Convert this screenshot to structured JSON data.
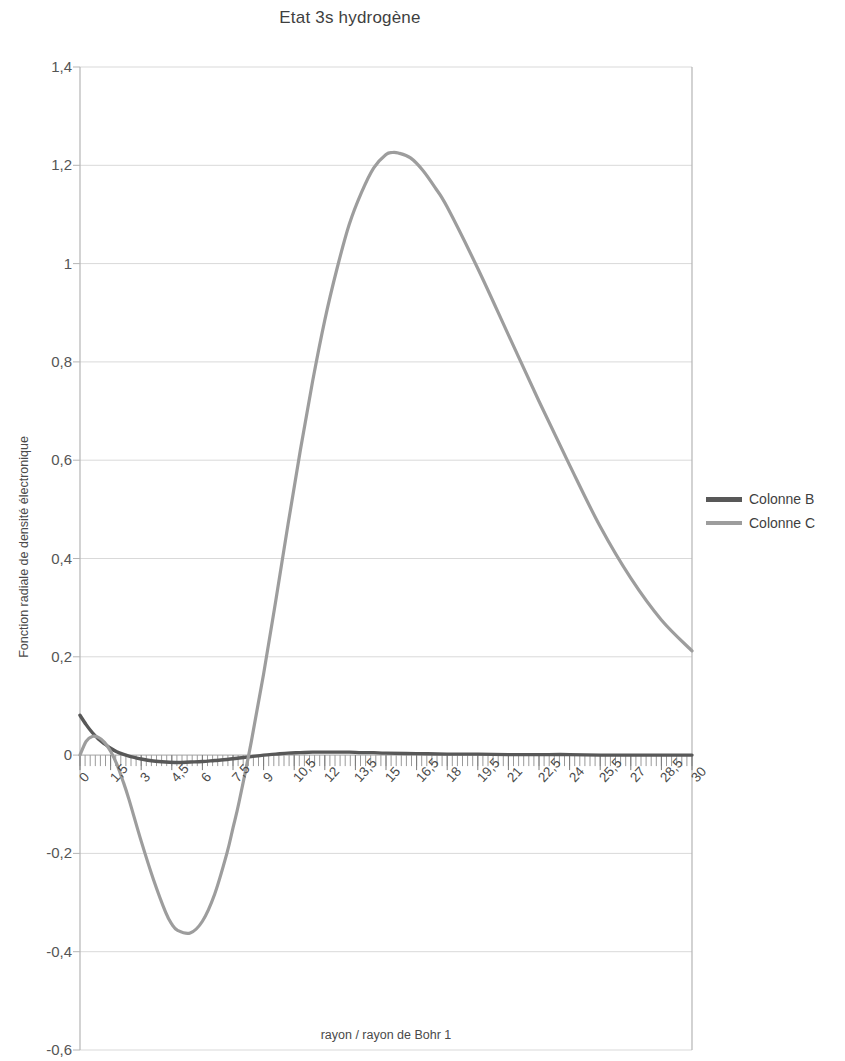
{
  "chart_data": {
    "type": "line",
    "title": "Etat 3s hydrogène",
    "xlabel": "rayon / rayon de Bohr 1",
    "ylabel": "Fonction radiale de densité électronique",
    "xlim": [
      0,
      30
    ],
    "ylim": [
      -0.6,
      1.4
    ],
    "grid": true,
    "legend_position": "right",
    "x_tick_labels": [
      "0",
      "1,5",
      "3",
      "4,5",
      "6",
      "7,5",
      "9",
      "10,5",
      "12",
      "13,5",
      "15",
      "16,5",
      "18",
      "19,5",
      "21",
      "22,5",
      "24",
      "25,5",
      "27",
      "28,5",
      "30"
    ],
    "x_tick_values": [
      0,
      1.5,
      3,
      4.5,
      6,
      7.5,
      9,
      10.5,
      12,
      13.5,
      15,
      16.5,
      18,
      19.5,
      21,
      22.5,
      24,
      25.5,
      27,
      28.5,
      30
    ],
    "y_tick_labels": [
      "1,4",
      "1,2",
      "1",
      "0,8",
      "0,6",
      "0,4",
      "0,2",
      "0",
      "-0,2",
      "-0,4",
      "-0,6"
    ],
    "y_tick_values": [
      1.4,
      1.2,
      1,
      0.8,
      0.6,
      0.4,
      0.2,
      0,
      -0.2,
      -0.4,
      -0.6
    ],
    "colors": {
      "series_b": "#585858",
      "series_c": "#9d9d9d",
      "grid": "#d9d9d9",
      "axis": "#b5b5b5",
      "text": "#4a4a4a"
    },
    "series": [
      {
        "name": "Colonne B",
        "color": "#585858",
        "x": [
          0,
          0.3,
          0.6,
          0.9,
          1.2,
          1.5,
          1.8,
          2.1,
          2.4,
          2.7,
          3,
          3.6,
          4.2,
          4.8,
          5.4,
          6,
          6.6,
          7.2,
          7.8,
          8.4,
          9,
          9.6,
          10.2,
          10.8,
          11.4,
          12,
          12.6,
          13.2,
          13.8,
          14.4,
          15,
          16.5,
          18,
          19.5,
          21,
          22.5,
          24,
          25.5,
          27,
          28.5,
          30
        ],
        "y": [
          0.081,
          0.062,
          0.046,
          0.033,
          0.023,
          0.014,
          0.007,
          0.002,
          -0.002,
          -0.005,
          -0.008,
          -0.012,
          -0.014,
          -0.015,
          -0.014,
          -0.013,
          -0.011,
          -0.009,
          -0.006,
          -0.003,
          0.0,
          0.002,
          0.004,
          0.005,
          0.006,
          0.006,
          0.006,
          0.006,
          0.005,
          0.005,
          0.004,
          0.003,
          0.002,
          0.002,
          0.001,
          0.001,
          0.001,
          0.0,
          0.0,
          0.0,
          0.0
        ]
      },
      {
        "name": "Colonne C",
        "color": "#9d9d9d",
        "x": [
          0,
          0.3,
          0.6,
          0.9,
          1.2,
          1.5,
          1.8,
          2.1,
          2.4,
          3,
          3.6,
          4.2,
          4.5,
          4.8,
          5.4,
          6,
          6.6,
          7.2,
          7.5,
          7.8,
          8.4,
          9,
          9.6,
          10.2,
          10.8,
          11.4,
          12,
          12.6,
          13.2,
          13.8,
          14.4,
          15,
          15.3,
          15.6,
          16.2,
          16.8,
          17.4,
          18,
          19.5,
          21,
          22.5,
          24,
          25.5,
          27,
          28.5,
          30
        ],
        "y": [
          0.0,
          0.028,
          0.038,
          0.036,
          0.026,
          0.008,
          -0.018,
          -0.052,
          -0.09,
          -0.175,
          -0.253,
          -0.32,
          -0.344,
          -0.357,
          -0.362,
          -0.338,
          -0.283,
          -0.2,
          -0.148,
          -0.095,
          0.028,
          0.165,
          0.315,
          0.47,
          0.62,
          0.76,
          0.885,
          0.99,
          1.08,
          1.145,
          1.195,
          1.222,
          1.226,
          1.225,
          1.215,
          1.19,
          1.155,
          1.115,
          0.99,
          0.855,
          0.72,
          0.59,
          0.465,
          0.36,
          0.275,
          0.212
        ]
      }
    ]
  },
  "legend": {
    "items": [
      {
        "label": "Colonne B",
        "color": "#585858"
      },
      {
        "label": "Colonne C",
        "color": "#9d9d9d"
      }
    ]
  }
}
